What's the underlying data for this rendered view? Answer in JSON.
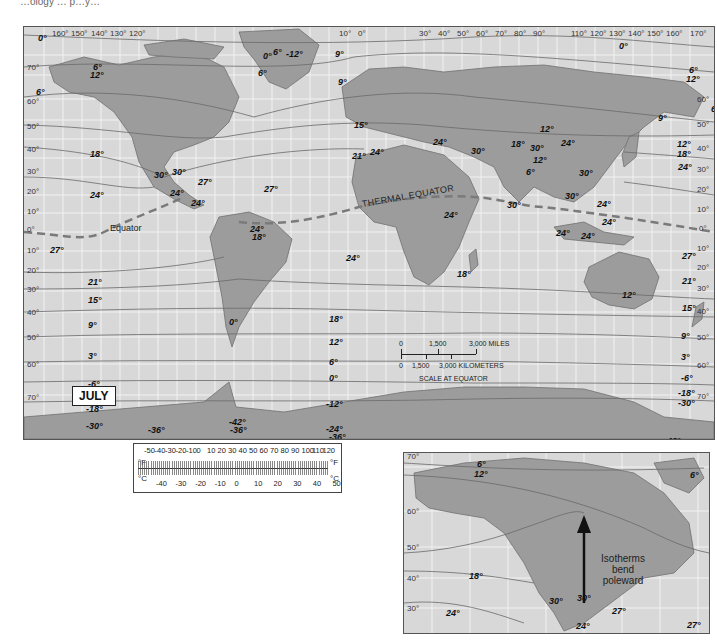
{
  "header": {
    "partial_text": "…ology … p…y…"
  },
  "map": {
    "month_label": "JULY",
    "thermal_equator_label": "THERMAL EQUATOR",
    "equator_label": "Equator",
    "colors": {
      "ocean": "#d8d8d8",
      "land": "#9a9a9a",
      "grid": "#f2f2f2",
      "isotherm": "#6a6a6a",
      "thermal_equator": "#7a7a7a"
    },
    "longitude_labels_top": [
      "160°",
      "150°",
      "140°",
      "130°",
      "120°",
      "10°",
      "0°",
      "30°",
      "40°",
      "50°",
      "60°",
      "70°",
      "80°",
      "90°",
      "110°",
      "120°",
      "130°",
      "140°",
      "150°",
      "160°",
      "170°"
    ],
    "latitude_labels_left": [
      "70°",
      "60°",
      "50°",
      "40°",
      "30°",
      "20°",
      "10°",
      "0°",
      "10°",
      "20°",
      "30°",
      "40°",
      "50°",
      "60°",
      "70°"
    ],
    "latitude_labels_right": [
      "60°",
      "50°",
      "40°",
      "30°",
      "20°",
      "10°",
      "0°",
      "10°",
      "20°",
      "30°",
      "40°",
      "50°",
      "60°",
      "70°"
    ],
    "isotherm_labels": [
      {
        "v": "0°",
        "x": 14,
        "y": 6
      },
      {
        "v": "6°",
        "x": 69,
        "y": 35
      },
      {
        "v": "12°",
        "x": 66,
        "y": 43
      },
      {
        "v": "6°",
        "x": 12,
        "y": 60
      },
      {
        "v": "0°",
        "x": 239,
        "y": 24
      },
      {
        "v": "6°",
        "x": 249,
        "y": 20
      },
      {
        "v": "-12°",
        "x": 262,
        "y": 22
      },
      {
        "v": "6°",
        "x": 234,
        "y": 41
      },
      {
        "v": "9°",
        "x": 311,
        "y": 22
      },
      {
        "v": "9°",
        "x": 314,
        "y": 50
      },
      {
        "v": "15°",
        "x": 330,
        "y": 93
      },
      {
        "v": "0°",
        "x": 595,
        "y": 14
      },
      {
        "v": "6°",
        "x": 665,
        "y": 38
      },
      {
        "v": "12°",
        "x": 662,
        "y": 47
      },
      {
        "v": "6°",
        "x": 687,
        "y": 77
      },
      {
        "v": "9°",
        "x": 634,
        "y": 86
      },
      {
        "v": "18°",
        "x": 66,
        "y": 122
      },
      {
        "v": "30°",
        "x": 130,
        "y": 143
      },
      {
        "v": "30°",
        "x": 148,
        "y": 140
      },
      {
        "v": "27°",
        "x": 174,
        "y": 150
      },
      {
        "v": "24°",
        "x": 146,
        "y": 161
      },
      {
        "v": "24°",
        "x": 167,
        "y": 171
      },
      {
        "v": "24°",
        "x": 66,
        "y": 163
      },
      {
        "v": "27°",
        "x": 26,
        "y": 218
      },
      {
        "v": "21°",
        "x": 328,
        "y": 124
      },
      {
        "v": "24°",
        "x": 346,
        "y": 120
      },
      {
        "v": "24°",
        "x": 409,
        "y": 110
      },
      {
        "v": "30°",
        "x": 447,
        "y": 119
      },
      {
        "v": "27°",
        "x": 240,
        "y": 157
      },
      {
        "v": "24°",
        "x": 226,
        "y": 197
      },
      {
        "v": "18°",
        "x": 228,
        "y": 205
      },
      {
        "v": "24°",
        "x": 420,
        "y": 183
      },
      {
        "v": "24°",
        "x": 322,
        "y": 226
      },
      {
        "v": "12°",
        "x": 516,
        "y": 97
      },
      {
        "v": "18°",
        "x": 487,
        "y": 112
      },
      {
        "v": "30°",
        "x": 506,
        "y": 116
      },
      {
        "v": "24°",
        "x": 537,
        "y": 111
      },
      {
        "v": "12°",
        "x": 509,
        "y": 128
      },
      {
        "v": "6°",
        "x": 502,
        "y": 140
      },
      {
        "v": "30°",
        "x": 555,
        "y": 141
      },
      {
        "v": "30°",
        "x": 541,
        "y": 164
      },
      {
        "v": "30°",
        "x": 483,
        "y": 173
      },
      {
        "v": "12°",
        "x": 653,
        "y": 112
      },
      {
        "v": "18°",
        "x": 653,
        "y": 122
      },
      {
        "v": "24°",
        "x": 654,
        "y": 135
      },
      {
        "v": "24°",
        "x": 573,
        "y": 172
      },
      {
        "v": "24°",
        "x": 578,
        "y": 190
      },
      {
        "v": "24°",
        "x": 532,
        "y": 201
      },
      {
        "v": "24°",
        "x": 557,
        "y": 204
      },
      {
        "v": "27°",
        "x": 658,
        "y": 224
      },
      {
        "v": "21°",
        "x": 64,
        "y": 250
      },
      {
        "v": "15°",
        "x": 64,
        "y": 268
      },
      {
        "v": "9°",
        "x": 64,
        "y": 293
      },
      {
        "v": "3°",
        "x": 64,
        "y": 324
      },
      {
        "v": "-6°",
        "x": 64,
        "y": 352
      },
      {
        "v": "-18°",
        "x": 62,
        "y": 377
      },
      {
        "v": "-30°",
        "x": 62,
        "y": 394
      },
      {
        "v": "-36°",
        "x": 124,
        "y": 398
      },
      {
        "v": "0°",
        "x": 205,
        "y": 290
      },
      {
        "v": "-42°",
        "x": 205,
        "y": 390
      },
      {
        "v": "-36°",
        "x": 206,
        "y": 398
      },
      {
        "v": "18°",
        "x": 305,
        "y": 287
      },
      {
        "v": "18°",
        "x": 433,
        "y": 242
      },
      {
        "v": "12°",
        "x": 305,
        "y": 310
      },
      {
        "v": "6°",
        "x": 305,
        "y": 330
      },
      {
        "v": "0°",
        "x": 305,
        "y": 346
      },
      {
        "v": "-12°",
        "x": 302,
        "y": 372
      },
      {
        "v": "-24°",
        "x": 302,
        "y": 397
      },
      {
        "v": "-36°",
        "x": 305,
        "y": 405
      },
      {
        "v": "-48°",
        "x": 310,
        "y": 413
      },
      {
        "v": "-60°",
        "x": 358,
        "y": 413
      },
      {
        "v": "-66°",
        "x": 418,
        "y": 420
      },
      {
        "v": "-66°",
        "x": 514,
        "y": 420
      },
      {
        "v": "-54°",
        "x": 608,
        "y": 410
      },
      {
        "v": "-42°",
        "x": 640,
        "y": 409
      },
      {
        "v": "21°",
        "x": 658,
        "y": 249
      },
      {
        "v": "12°",
        "x": 598,
        "y": 263
      },
      {
        "v": "15°",
        "x": 658,
        "y": 276
      },
      {
        "v": "9°",
        "x": 657,
        "y": 304
      },
      {
        "v": "3°",
        "x": 657,
        "y": 325
      },
      {
        "v": "-6°",
        "x": 657,
        "y": 346
      },
      {
        "v": "-18°",
        "x": 654,
        "y": 361
      },
      {
        "v": "-30°",
        "x": 654,
        "y": 371
      }
    ],
    "scale_bar": {
      "miles_labels": [
        "0",
        "1,500",
        "3,000 MILES"
      ],
      "km_labels": [
        "0",
        "1,500",
        "3,000 KILOMETERS"
      ],
      "caption": "SCALE AT EQUATOR"
    }
  },
  "thermometer": {
    "fahrenheit_unit": "°F",
    "celsius_unit": "°C",
    "fahrenheit_ticks": [
      "-50",
      "-40",
      "-30",
      "-20",
      "-10",
      "0",
      "10",
      "20",
      "30",
      "40",
      "50",
      "60",
      "70",
      "80",
      "90",
      "100",
      "110",
      "120"
    ],
    "celsius_ticks": [
      "-40",
      "-30",
      "-20",
      "-10",
      "0",
      "10",
      "20",
      "30",
      "40",
      "50"
    ]
  },
  "inset": {
    "annotation": "Isotherms bend poleward",
    "annotation_lines": [
      "Isotherms",
      "bend",
      "poleward"
    ],
    "latitude_labels": [
      "70°",
      "60°",
      "50°",
      "40°",
      "30°"
    ],
    "isotherm_labels": [
      {
        "v": "6°",
        "x": 73,
        "y": 6
      },
      {
        "v": "12°",
        "x": 70,
        "y": 16
      },
      {
        "v": "6°",
        "x": 286,
        "y": 17
      },
      {
        "v": "18°",
        "x": 65,
        "y": 118
      },
      {
        "v": "30°",
        "x": 145,
        "y": 143
      },
      {
        "v": "30°",
        "x": 173,
        "y": 140
      },
      {
        "v": "27°",
        "x": 208,
        "y": 153
      },
      {
        "v": "24°",
        "x": 42,
        "y": 155
      },
      {
        "v": "24°",
        "x": 172,
        "y": 168
      },
      {
        "v": "27°",
        "x": 283,
        "y": 167
      }
    ]
  }
}
